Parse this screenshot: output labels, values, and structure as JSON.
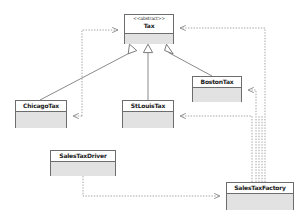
{
  "diagram": {
    "canvas": {
      "width": 306,
      "height": 218,
      "background": "#ffffff"
    },
    "style": {
      "node_border": "#6d6d6d",
      "node_body_fill": "#e2e2e2",
      "node_header_fill": "#ffffff",
      "solid_edge_color": "#8a8a8a",
      "dashed_edge_color": "#9a9a9a",
      "text_color": "#1a1a1a"
    },
    "classes": [
      {
        "id": "tax",
        "stereotype": "<<abstract>>",
        "name": "Tax",
        "x": 124,
        "y": 14,
        "w": 50,
        "h": 30,
        "header_h": 19,
        "abstract": true
      },
      {
        "id": "bostontax",
        "stereotype": "",
        "name": "BostonTax",
        "x": 192,
        "y": 76,
        "w": 50,
        "h": 26,
        "header_h": 11,
        "abstract": false
      },
      {
        "id": "chicagotax",
        "stereotype": "",
        "name": "ChicagoTax",
        "x": 15,
        "y": 100,
        "w": 52,
        "h": 28,
        "header_h": 11,
        "abstract": false
      },
      {
        "id": "stlouistax",
        "stereotype": "",
        "name": "StLouisTax",
        "x": 122,
        "y": 100,
        "w": 52,
        "h": 28,
        "header_h": 11,
        "abstract": false
      },
      {
        "id": "salestaxdriver",
        "stereotype": "",
        "name": "SalesTaxDriver",
        "x": 50,
        "y": 150,
        "w": 66,
        "h": 26,
        "header_h": 11,
        "abstract": false
      },
      {
        "id": "salestaxfactory",
        "stereotype": "",
        "name": "SalesTaxFactory",
        "x": 226,
        "y": 182,
        "w": 68,
        "h": 28,
        "header_h": 11,
        "abstract": false
      }
    ],
    "relationships": [
      {
        "id": "r1",
        "type": "generalization",
        "from": "chicagotax",
        "to": "tax",
        "arrow": "hollow-triangle",
        "line": "solid"
      },
      {
        "id": "r2",
        "type": "generalization",
        "from": "stlouistax",
        "to": "tax",
        "arrow": "hollow-triangle",
        "line": "solid"
      },
      {
        "id": "r3",
        "type": "generalization",
        "from": "bostontax",
        "to": "tax",
        "arrow": "hollow-triangle",
        "line": "solid"
      },
      {
        "id": "r4",
        "type": "dependency",
        "from": "chicagotax",
        "to": "tax",
        "arrow": "open",
        "line": "dashed"
      },
      {
        "id": "r5",
        "type": "dependency",
        "from": "salestaxfactory",
        "to": "tax",
        "arrow": "open",
        "line": "dashed"
      },
      {
        "id": "r6",
        "type": "dependency",
        "from": "salestaxfactory",
        "to": "bostontax",
        "arrow": "open",
        "line": "dashed"
      },
      {
        "id": "r7",
        "type": "dependency",
        "from": "salestaxfactory",
        "to": "stlouistax",
        "arrow": "open",
        "line": "dashed"
      },
      {
        "id": "r8",
        "type": "dependency",
        "from": "salestaxdriver",
        "to": "salestaxfactory",
        "arrow": "open",
        "line": "dashed"
      }
    ]
  }
}
